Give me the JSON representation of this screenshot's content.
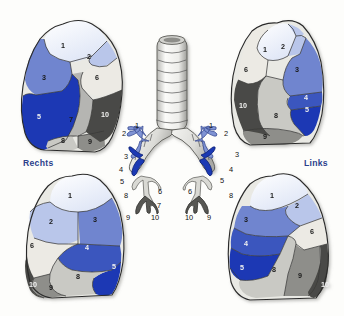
{
  "figure": {
    "type": "anatomical-diagram",
    "background_color": "#fdfdfb"
  },
  "labels": {
    "right_side": "Rechts",
    "left_side": "Links",
    "label_color": "#2b3f8c"
  },
  "segment_palette": {
    "s1": "#dfe6f6",
    "s2": "#b9c6ea",
    "s3": "#6f85cf",
    "s4": "#3a56be",
    "s5": "#1b39b4",
    "s6": "#eceae4",
    "s7": "#b5b5b2",
    "s8": "#c9c9c4",
    "s9": "#8e8e8a",
    "s10": "#4a4a46"
  },
  "views": [
    {
      "id": "right-lateral",
      "name": "Rechte Lunge, laterale Ansicht",
      "position": "top-left",
      "segments": [
        {
          "n": "1",
          "color": "#dfe6f6",
          "x": 63,
          "y": 46
        },
        {
          "n": "2",
          "color": "#b9c6ea",
          "x": 89,
          "y": 57
        },
        {
          "n": "3",
          "color": "#6f85cf",
          "x": 44,
          "y": 78
        },
        {
          "n": "5",
          "color": "#1b39b4",
          "x": 39,
          "y": 117
        },
        {
          "n": "6",
          "color": "#eceae4",
          "x": 97,
          "y": 78
        },
        {
          "n": "7",
          "color": "#b5b5b2",
          "x": 71,
          "y": 120
        },
        {
          "n": "8",
          "color": "#c9c9c4",
          "x": 63,
          "y": 141
        },
        {
          "n": "9",
          "color": "#8e8e8a",
          "x": 90,
          "y": 142
        },
        {
          "n": "10",
          "color": "#4a4a46",
          "x": 105,
          "y": 115
        }
      ]
    },
    {
      "id": "left-lateral",
      "name": "Linke Lunge, laterale Ansicht",
      "position": "top-right",
      "segments": [
        {
          "n": "1",
          "color": "#dfe6f6",
          "x": 265,
          "y": 50
        },
        {
          "n": "2",
          "color": "#b9c6ea",
          "x": 283,
          "y": 47
        },
        {
          "n": "3",
          "color": "#6f85cf",
          "x": 297,
          "y": 70
        },
        {
          "n": "4",
          "color": "#3a56be",
          "x": 306,
          "y": 98
        },
        {
          "n": "5",
          "color": "#1b39b4",
          "x": 307,
          "y": 110
        },
        {
          "n": "6",
          "color": "#eceae4",
          "x": 246,
          "y": 70
        },
        {
          "n": "8",
          "color": "#c9c9c4",
          "x": 276,
          "y": 116
        },
        {
          "n": "9",
          "color": "#8e8e8a",
          "x": 265,
          "y": 137
        },
        {
          "n": "10",
          "color": "#4a4a46",
          "x": 243,
          "y": 106
        }
      ]
    },
    {
      "id": "right-medial",
      "name": "Rechte Lunge, mediale Ansicht",
      "position": "bottom-left",
      "segments": [
        {
          "n": "1",
          "color": "#dfe6f6",
          "x": 70,
          "y": 196
        },
        {
          "n": "2",
          "color": "#b9c6ea",
          "x": 51,
          "y": 222
        },
        {
          "n": "3",
          "color": "#6f85cf",
          "x": 95,
          "y": 220
        },
        {
          "n": "4",
          "color": "#3a56be",
          "x": 87,
          "y": 248
        },
        {
          "n": "5",
          "color": "#1b39b4",
          "x": 114,
          "y": 267
        },
        {
          "n": "6",
          "color": "#eceae4",
          "x": 32,
          "y": 246
        },
        {
          "n": "8",
          "color": "#c9c9c4",
          "x": 78,
          "y": 277
        },
        {
          "n": "9",
          "color": "#8e8e8a",
          "x": 51,
          "y": 288
        },
        {
          "n": "10",
          "color": "#4a4a46",
          "x": 33,
          "y": 285
        }
      ]
    },
    {
      "id": "left-medial",
      "name": "Linke Lunge, mediale Ansicht",
      "position": "bottom-right",
      "segments": [
        {
          "n": "1",
          "color": "#dfe6f6",
          "x": 272,
          "y": 196
        },
        {
          "n": "2",
          "color": "#b9c6ea",
          "x": 297,
          "y": 206
        },
        {
          "n": "3",
          "color": "#6f85cf",
          "x": 246,
          "y": 220
        },
        {
          "n": "4",
          "color": "#3a56be",
          "x": 246,
          "y": 244
        },
        {
          "n": "5",
          "color": "#1b39b4",
          "x": 242,
          "y": 268
        },
        {
          "n": "6",
          "color": "#eceae4",
          "x": 312,
          "y": 232
        },
        {
          "n": "8",
          "color": "#c9c9c4",
          "x": 274,
          "y": 270
        },
        {
          "n": "9",
          "color": "#8e8e8a",
          "x": 300,
          "y": 276
        },
        {
          "n": "10",
          "color": "#4a4a46",
          "x": 325,
          "y": 285
        }
      ]
    }
  ],
  "bronchial_tree": {
    "name": "Trachea und Bronchialbaum",
    "trachea_rings": 9,
    "right_branch_labels": [
      {
        "n": "1",
        "x": 137,
        "y": 126
      },
      {
        "n": "2",
        "x": 124,
        "y": 134
      },
      {
        "n": "3",
        "x": 126,
        "y": 157
      },
      {
        "n": "4",
        "x": 121,
        "y": 170
      },
      {
        "n": "5",
        "x": 122,
        "y": 182
      },
      {
        "n": "6",
        "x": 160,
        "y": 192
      },
      {
        "n": "7",
        "x": 159,
        "y": 206
      },
      {
        "n": "8",
        "x": 126,
        "y": 196
      },
      {
        "n": "9",
        "x": 128,
        "y": 218
      },
      {
        "n": "10",
        "x": 155,
        "y": 218
      }
    ],
    "left_branch_labels": [
      {
        "n": "1",
        "x": 211,
        "y": 126
      },
      {
        "n": "2",
        "x": 226,
        "y": 134
      },
      {
        "n": "3",
        "x": 237,
        "y": 155
      },
      {
        "n": "4",
        "x": 231,
        "y": 170
      },
      {
        "n": "5",
        "x": 222,
        "y": 181
      },
      {
        "n": "6",
        "x": 190,
        "y": 192
      },
      {
        "n": "8",
        "x": 231,
        "y": 196
      },
      {
        "n": "9",
        "x": 209,
        "y": 218
      },
      {
        "n": "10",
        "x": 189,
        "y": 218
      }
    ]
  }
}
